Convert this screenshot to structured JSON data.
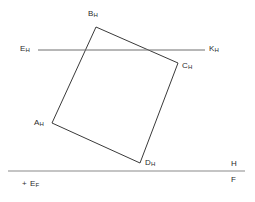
{
  "figure": {
    "type": "descriptive-geometry-projection",
    "background_color": "#ffffff",
    "stroke_color": "#3a3a3a",
    "ground_line_color": "#8a8a8a",
    "text_color": "#2b2b2b",
    "width": 255,
    "height": 202
  },
  "labels": {
    "b": {
      "base": "B",
      "sub": "H"
    },
    "e": {
      "base": "E",
      "sub": "H"
    },
    "k": {
      "base": "K",
      "sub": "H"
    },
    "c": {
      "base": "C",
      "sub": "H"
    },
    "a": {
      "base": "A",
      "sub": "H"
    },
    "d": {
      "base": "D",
      "sub": "H"
    },
    "ground_upper": "H",
    "ground_lower": "F",
    "point_ef": {
      "marker": "+",
      "base": "E",
      "sub": "F"
    }
  },
  "geometry": {
    "quadrilateral": {
      "name": "A-B-C-D",
      "points": "52,123 96,27 178,63 140,163",
      "vertices": [
        {
          "id": "A",
          "x": 52,
          "y": 123
        },
        {
          "id": "B",
          "x": 96,
          "y": 27
        },
        {
          "id": "C",
          "x": 178,
          "y": 63
        },
        {
          "id": "D",
          "x": 140,
          "y": 163
        }
      ]
    },
    "horizontal_line_ek": {
      "x1": 38,
      "y1": 50,
      "x2": 205,
      "y2": 50
    },
    "ground_line_hf": {
      "x1": 8,
      "y1": 171,
      "x2": 245,
      "y2": 171
    }
  }
}
